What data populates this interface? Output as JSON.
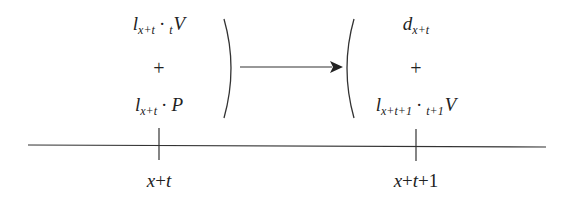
{
  "diagram": {
    "left_group": {
      "top": {
        "base": "l",
        "sub": "x+t",
        "op": "·",
        "pre_sub": "t",
        "var": "V"
      },
      "plus": "+",
      "bottom": {
        "base": "l",
        "sub": "x+t",
        "op": "·",
        "var": "P"
      }
    },
    "right_group": {
      "top": {
        "base": "d",
        "sub": "x+t"
      },
      "plus": "+",
      "bottom": {
        "base": "l",
        "sub": "x+t+1",
        "op": "·",
        "pre_sub": "t+1",
        "var": "V"
      }
    },
    "arrow": {
      "from": "left_group",
      "to": "right_group"
    },
    "timeline": {
      "ticks": [
        {
          "label_var1": "x",
          "label_rest": "+",
          "label_var2": "t",
          "label_tail": ""
        },
        {
          "label_var1": "x",
          "label_rest": "+",
          "label_var2": "t",
          "label_tail": "+1"
        }
      ]
    },
    "colors": {
      "ink": "#222222",
      "background": "#ffffff"
    }
  }
}
